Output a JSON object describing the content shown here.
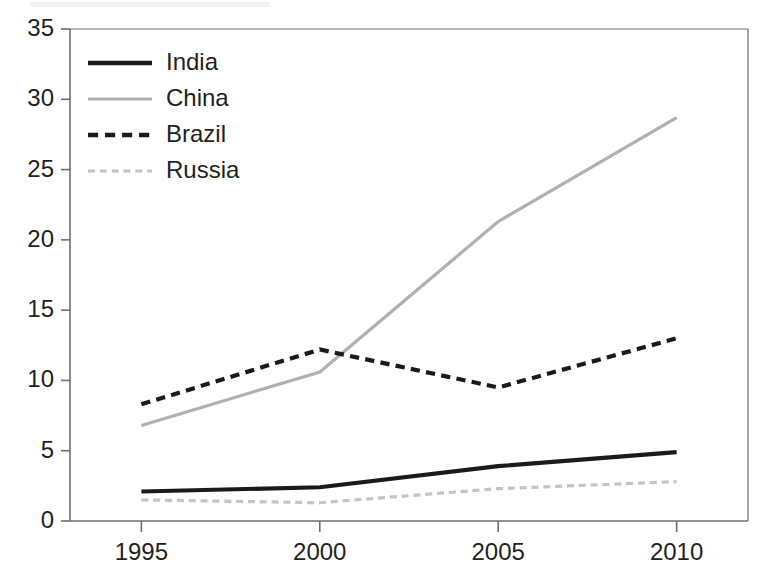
{
  "chart_data": {
    "type": "line",
    "title": "",
    "subtitle": "",
    "xlabel": "",
    "ylabel": "",
    "x": [
      1995,
      2000,
      2005,
      2010
    ],
    "categories": [
      "1995",
      "2000",
      "2005",
      "2010"
    ],
    "series": [
      {
        "name": "India",
        "values": [
          2.1,
          2.4,
          3.9,
          4.9
        ],
        "color": "#1a1a1a",
        "style": "solid"
      },
      {
        "name": "China",
        "values": [
          6.8,
          10.6,
          21.3,
          28.7
        ],
        "color": "#b0b0b0",
        "style": "solid"
      },
      {
        "name": "Brazil",
        "values": [
          8.3,
          12.2,
          9.5,
          13.0
        ],
        "color": "#1a1a1a",
        "style": "dashed"
      },
      {
        "name": "Russia",
        "values": [
          1.5,
          1.3,
          2.3,
          2.8
        ],
        "color": "#c4c4c4",
        "style": "dashed"
      }
    ],
    "xlim": [
      1993.0,
      2012.0
    ],
    "ylim": [
      0,
      35
    ],
    "yticks": [
      0,
      5,
      10,
      15,
      20,
      25,
      30,
      35
    ],
    "ytick_labels": [
      "0",
      "5",
      "10",
      "15",
      "20",
      "25",
      "30",
      "35"
    ],
    "xticks": [
      1995,
      2000,
      2005,
      2010
    ],
    "xtick_labels": [
      "1995",
      "2000",
      "2005",
      "2010"
    ],
    "grid": false,
    "legend_position": "upper left",
    "legend_entries": [
      "India",
      "China",
      "Brazil",
      "Russia"
    ],
    "axis_color": "#6e6e6e",
    "background": "#ffffff"
  }
}
